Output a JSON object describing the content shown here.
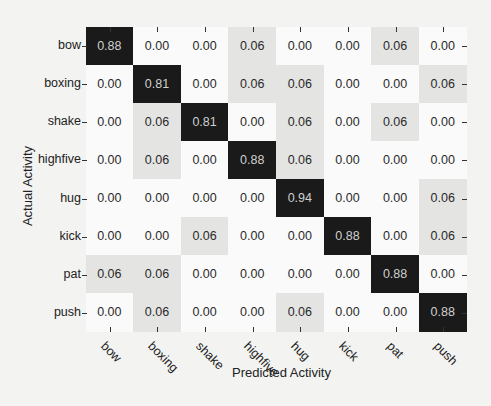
{
  "chart_data": {
    "type": "heatmap",
    "title": "",
    "xlabel": "Predicted Activity",
    "ylabel": "Actual Activity",
    "x_categories": [
      "bow",
      "boxing",
      "shake",
      "highfive",
      "hug",
      "kick",
      "pat",
      "push"
    ],
    "y_categories": [
      "bow",
      "boxing",
      "shake",
      "highfive",
      "hug",
      "kick",
      "pat",
      "push"
    ],
    "values": [
      [
        0.88,
        0.0,
        0.0,
        0.06,
        0.0,
        0.0,
        0.06,
        0.0
      ],
      [
        0.0,
        0.81,
        0.0,
        0.06,
        0.06,
        0.0,
        0.0,
        0.06
      ],
      [
        0.0,
        0.06,
        0.81,
        0.0,
        0.06,
        0.0,
        0.06,
        0.0
      ],
      [
        0.0,
        0.06,
        0.0,
        0.88,
        0.06,
        0.0,
        0.0,
        0.0
      ],
      [
        0.0,
        0.0,
        0.0,
        0.0,
        0.94,
        0.0,
        0.0,
        0.06
      ],
      [
        0.0,
        0.0,
        0.06,
        0.0,
        0.0,
        0.88,
        0.0,
        0.06
      ],
      [
        0.06,
        0.06,
        0.0,
        0.0,
        0.0,
        0.0,
        0.88,
        0.0
      ],
      [
        0.0,
        0.06,
        0.0,
        0.0,
        0.06,
        0.0,
        0.0,
        0.88
      ]
    ],
    "value_format": "0.00",
    "colormap": "gray_r",
    "grid": false,
    "legend": "none"
  },
  "colors": {
    "high": "#1a1a1a",
    "low_nonzero": "#e4e4e2",
    "zero": "#fafafa",
    "text_dark_cell": "#cfcfcf",
    "text_light_cell": "#2a2a2a"
  }
}
